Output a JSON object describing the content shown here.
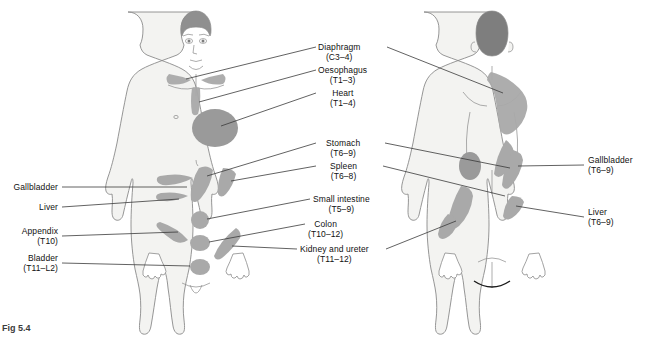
{
  "figure": {
    "caption": "Fig 5.4",
    "views": [
      {
        "name": "anterior-body-view"
      },
      {
        "name": "posterior-body-view"
      }
    ]
  },
  "colors": {
    "outline": "#8a8a8a",
    "body_fill": "#f3f3f1",
    "patch_gray": "#a9a9a9",
    "patch_dark": "#9a9a9a",
    "hair_gray": "#8f8f8f",
    "hair_dark": "#7e7e7e",
    "leader": "#3a3a3a",
    "text": "#111111"
  },
  "labels_center": [
    {
      "name": "diaphragm",
      "title": "Diaphragm",
      "level": "(C3–4)"
    },
    {
      "name": "oesophagus",
      "title": "Oesophagus",
      "level": "(T1–3)"
    },
    {
      "name": "heart",
      "title": "Heart",
      "level": "(T1–4)"
    },
    {
      "name": "stomach",
      "title": "Stomach",
      "level": "(T6–9)"
    },
    {
      "name": "spleen",
      "title": "Spleen",
      "level": "(T6–8)"
    },
    {
      "name": "small-intestine",
      "title": "Small intestine",
      "level": "(T5–9)"
    },
    {
      "name": "colon",
      "title": "Colon",
      "level": "(T10–12)"
    },
    {
      "name": "kidney-and-ureter",
      "title": "Kidney and ureter",
      "level": "(T11–12)"
    }
  ],
  "labels_left": [
    {
      "name": "gallbladder",
      "title": "Gallbladder",
      "level": ""
    },
    {
      "name": "liver",
      "title": "Liver",
      "level": ""
    },
    {
      "name": "appendix",
      "title": "Appendix",
      "level": "(T10)"
    },
    {
      "name": "bladder",
      "title": "Bladder",
      "level": "(T11–L2)"
    }
  ],
  "labels_right": [
    {
      "name": "gallbladder-posterior",
      "title": "Gallbladder",
      "level": "(T6–9)"
    },
    {
      "name": "liver-posterior",
      "title": "Liver",
      "level": "(T6–9)"
    }
  ]
}
